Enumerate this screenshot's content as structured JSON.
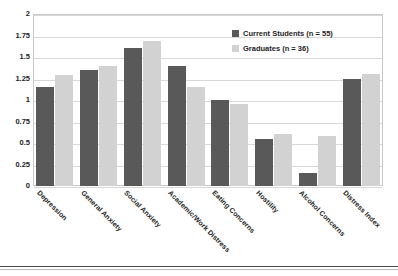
{
  "chart_data": {
    "type": "bar",
    "title": "",
    "xlabel": "",
    "ylabel": "",
    "ylim": [
      0,
      2
    ],
    "yticks": [
      "0",
      "0.25",
      "0.5",
      "0.75",
      "1",
      "1.25",
      "1.5",
      "1.75",
      "2"
    ],
    "ytick_values": [
      0,
      0.25,
      0.5,
      0.75,
      1,
      1.25,
      1.5,
      1.75,
      2
    ],
    "grid": true,
    "legend_position": "top-right",
    "categories": [
      "Depression",
      "General Anxiety",
      "Social Anxiety",
      "Academic/Work Distress",
      "Eating Concerns",
      "Hostility",
      "Alcohol Concerns",
      "Distress Index"
    ],
    "series": [
      {
        "name": "Current Students (n = 55)",
        "color": "#595959",
        "values": [
          1.15,
          1.35,
          1.6,
          1.4,
          1.0,
          0.55,
          0.15,
          1.25
        ]
      },
      {
        "name": "Graduates (n = 36)",
        "color": "#d2d2d2",
        "values": [
          1.29,
          1.39,
          1.69,
          1.15,
          0.95,
          0.6,
          0.58,
          1.3
        ]
      }
    ]
  },
  "legend": {
    "entries": [
      {
        "label": "Current Students (n = 55)"
      },
      {
        "label": "Graduates (n = 36)"
      }
    ]
  }
}
